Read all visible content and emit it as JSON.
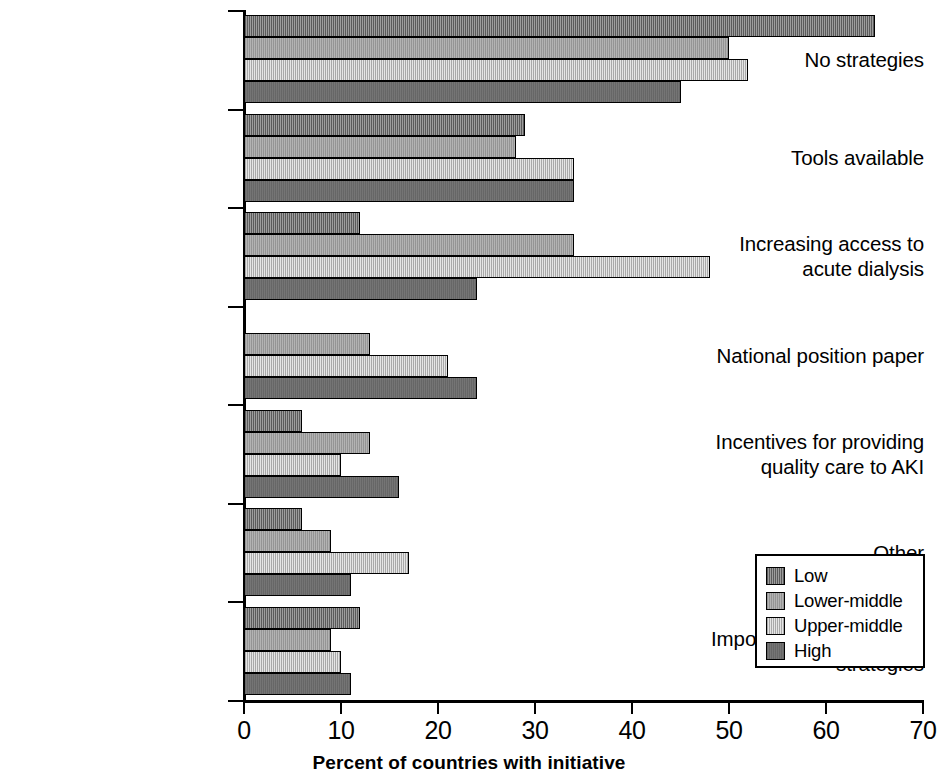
{
  "chart_data": {
    "type": "bar",
    "orientation": "horizontal",
    "title": "",
    "xlabel": "Percent of countries with initiative",
    "ylabel": "",
    "xlim": [
      0,
      70
    ],
    "xticks": [
      0,
      10,
      20,
      30,
      40,
      50,
      60,
      70
    ],
    "grid": false,
    "legend_position": "bottom-right",
    "categories": [
      "No strategies",
      "Tools available",
      "Increasing access to acute dialysis",
      "National position paper",
      "Incentives for providing quality care to AKI",
      "Other",
      "Important regional/state strategies"
    ],
    "category_lines": [
      [
        "No strategies"
      ],
      [
        "Tools available"
      ],
      [
        "Increasing access to",
        "acute dialysis"
      ],
      [
        "National position paper"
      ],
      [
        "Incentives for providing",
        "quality care to AKI"
      ],
      [
        "Other"
      ],
      [
        "Important regional/state",
        "strategies"
      ]
    ],
    "series": [
      {
        "name": "Low",
        "color": "#828282",
        "values": [
          65,
          29,
          12,
          0,
          6,
          6,
          12
        ]
      },
      {
        "name": "Lower-middle",
        "color": "#a9a9a9",
        "values": [
          50,
          28,
          34,
          13,
          13,
          9,
          9
        ]
      },
      {
        "name": "Upper-middle",
        "color": "#d8d8d8",
        "values": [
          52,
          34,
          48,
          21,
          10,
          17,
          10
        ]
      },
      {
        "name": "High",
        "color": "#6e6e6e",
        "values": [
          45,
          34,
          24,
          24,
          16,
          11,
          11
        ]
      }
    ]
  },
  "legend": {
    "entries": [
      {
        "label": "Low"
      },
      {
        "label": "Lower-middle"
      },
      {
        "label": "Upper-middle"
      },
      {
        "label": "High"
      }
    ]
  },
  "axis": {
    "x_title": "Percent of countries with initiative",
    "x_tick_labels": [
      "0",
      "10",
      "20",
      "30",
      "40",
      "50",
      "60",
      "70"
    ]
  }
}
